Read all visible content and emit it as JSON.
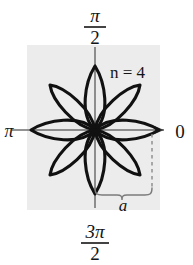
{
  "figure": {
    "panel": {
      "background_color": "#ececec",
      "x": 27,
      "y": 45,
      "width": 133,
      "height": 165
    },
    "curve": {
      "equation_label": "n = 4",
      "petal_count": 8,
      "max_radius_label": "a",
      "stroke_color": "#111111"
    },
    "axes": {
      "color": "#6e6e6e",
      "center_x": 95,
      "center_y": 130
    }
  },
  "labels": {
    "top": {
      "numerator": "π",
      "denominator": "2"
    },
    "bottom": {
      "numerator": "3π",
      "denominator": "2"
    },
    "left": "π",
    "right": "0",
    "annotation": "n = 4",
    "measure": "a"
  },
  "icons": {
    "axis_arrow": "arrow-right-icon",
    "brace": "curly-brace-icon",
    "dashed_guide": "dashed-line-icon"
  },
  "colors": {
    "panel_gray": "#ececec",
    "curve_black": "#111111",
    "axis_gray": "#6e6e6e",
    "guide_gray": "#8a8a8a",
    "text_black": "#141414"
  }
}
